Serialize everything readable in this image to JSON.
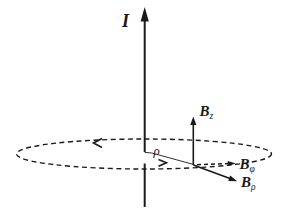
{
  "figure": {
    "background_color": "#ffffff",
    "ink_color": "#1a1a1a",
    "labels": {
      "current": "I",
      "radius": "ρ"
    },
    "field_components": [
      {
        "base": "B",
        "sub": "z"
      },
      {
        "base": "B",
        "sub": "φ"
      },
      {
        "base": "B",
        "sub": "ρ"
      }
    ]
  }
}
